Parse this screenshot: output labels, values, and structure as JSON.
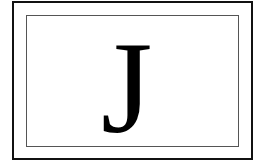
{
  "card": {
    "letter": "J",
    "colors": {
      "outer_border": "#111111",
      "inner_border": "#555555",
      "letter": "#000000",
      "background": "#ffffff"
    }
  }
}
